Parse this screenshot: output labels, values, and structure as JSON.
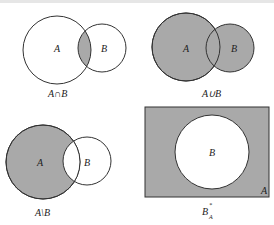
{
  "colors": {
    "shade": "#a9a9a9",
    "stroke": "#333333",
    "background": "#ffffff"
  },
  "diagrams": [
    {
      "caption": "A∩B",
      "set_a": "A",
      "set_b": "B",
      "shaded": "intersection"
    },
    {
      "caption": "A∪B",
      "set_a": "A",
      "set_b": "B",
      "shaded": "union"
    },
    {
      "caption": "A\\B",
      "set_a": "A",
      "set_b": "B",
      "shaded": "difference"
    },
    {
      "caption": "B",
      "caption_sup": "*",
      "caption_sub": "A",
      "set_inner": "B",
      "set_universe": "A",
      "shaded": "complement"
    }
  ]
}
